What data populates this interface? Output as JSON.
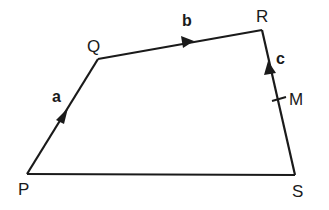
{
  "diagram": {
    "type": "quadrilateral-vectors",
    "stroke_color": "#1a1a1a",
    "background": "#ffffff",
    "vertices": [
      {
        "name": "P",
        "x": 27,
        "y": 174
      },
      {
        "name": "Q",
        "x": 98,
        "y": 59
      },
      {
        "name": "R",
        "x": 262,
        "y": 30
      },
      {
        "name": "S",
        "x": 295,
        "y": 175
      }
    ],
    "midpoint": {
      "name": "M",
      "on_edge": "RS",
      "x": 279,
      "y": 99
    },
    "vectors": [
      {
        "label": "a",
        "from": "P",
        "to": "Q"
      },
      {
        "label": "b",
        "from": "Q",
        "to": "R"
      },
      {
        "label": "c",
        "from": "M",
        "to": "R"
      }
    ],
    "labels": {
      "P": "P",
      "Q": "Q",
      "R": "R",
      "S": "S",
      "M": "M",
      "a": "a",
      "b": "b",
      "c": "c"
    }
  }
}
